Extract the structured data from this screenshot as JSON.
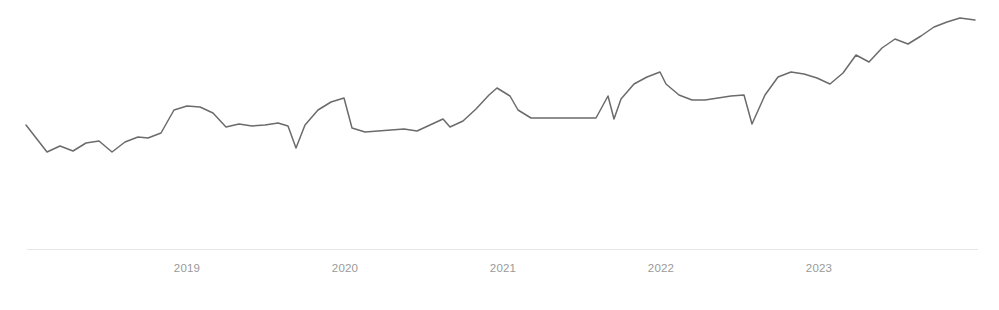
{
  "chart_data": {
    "type": "line",
    "title": "",
    "subtitle": "",
    "xlabel": "",
    "ylabel": "",
    "grid": false,
    "legend": null,
    "axis_color": "#e6e6e6",
    "series_color": "#6b6b6b",
    "tick_label_color": "#9a9a9a",
    "background": "#ffffff",
    "xlim": [
      "2018-09",
      "2024-06"
    ],
    "ylim": [
      0,
      100
    ],
    "x_tick_labels": [
      "2019",
      "2020",
      "2021",
      "2022",
      "2023"
    ],
    "x_tick_positions_px": [
      187,
      345,
      503,
      661,
      819
    ],
    "x": [
      "2018-09",
      "2018-10",
      "2018-11",
      "2018-12",
      "2019-01",
      "2019-02",
      "2019-03",
      "2019-04",
      "2019-05",
      "2019-06",
      "2019-07",
      "2019-08",
      "2019-09",
      "2019-10",
      "2019-11",
      "2019-12",
      "2020-01",
      "2020-02",
      "2020-03",
      "2020-04",
      "2020-05",
      "2020-06",
      "2020-07",
      "2020-08",
      "2020-09",
      "2020-10",
      "2020-11",
      "2020-12",
      "2021-01",
      "2021-02",
      "2021-03",
      "2021-04",
      "2021-05",
      "2021-06",
      "2021-07",
      "2021-08",
      "2021-09",
      "2021-10",
      "2021-11",
      "2021-12",
      "2022-01",
      "2022-02",
      "2022-03",
      "2022-04",
      "2022-05",
      "2022-06",
      "2022-07",
      "2022-08",
      "2022-09",
      "2022-10",
      "2022-11",
      "2022-12",
      "2023-01",
      "2023-02",
      "2023-03",
      "2023-04",
      "2023-05",
      "2023-06",
      "2023-07",
      "2023-08",
      "2023-09",
      "2023-10",
      "2023-11",
      "2023-12",
      "2024-01",
      "2024-02",
      "2024-03",
      "2024-04",
      "2024-05",
      "2024-06",
      "2024-07",
      "2024-08"
    ],
    "values": [
      55.0,
      44.5,
      47.0,
      45.0,
      48.5,
      49.5,
      44.0,
      49.0,
      51.5,
      51.0,
      52.5,
      53.0,
      53.5,
      49.5,
      51.5,
      62.0,
      65.0,
      64.5,
      62.0,
      57.5,
      58.0,
      54.0,
      45.5,
      54.5,
      57.0,
      56.5,
      56.0,
      49.0,
      54.0,
      69.0,
      67.5,
      58.5,
      56.0,
      61.0,
      59.5,
      59.0,
      57.5,
      58.0,
      59.0,
      58.0,
      57.5,
      57.5,
      65.5,
      57.0,
      72.0,
      69.5,
      74.5,
      71.0,
      66.5,
      64.5,
      65.5,
      68.0,
      67.5,
      68.0,
      58.5,
      70.0,
      74.5,
      73.0,
      73.5,
      72.0,
      70.5,
      69.5,
      71.5,
      75.5,
      79.0,
      75.0,
      72.5,
      78.5,
      83.5,
      88.0,
      90.0,
      92.0
    ],
    "points_px": [
      [
        26,
        125
      ],
      [
        47,
        152
      ],
      [
        60,
        146
      ],
      [
        73,
        151
      ],
      [
        86,
        143
      ],
      [
        99,
        141
      ],
      [
        112,
        152
      ],
      [
        125,
        142
      ],
      [
        138,
        137
      ],
      [
        148,
        138
      ],
      [
        161,
        133
      ],
      [
        174,
        110
      ],
      [
        187,
        106
      ],
      [
        200,
        107
      ],
      [
        213,
        113
      ],
      [
        226,
        127
      ],
      [
        239,
        124
      ],
      [
        252,
        126
      ],
      [
        265,
        125
      ],
      [
        278,
        123
      ],
      [
        288,
        126
      ],
      [
        296,
        148
      ],
      [
        305,
        125
      ],
      [
        318,
        110
      ],
      [
        331,
        102
      ],
      [
        344,
        98
      ],
      [
        352,
        128
      ],
      [
        365,
        132
      ],
      [
        378,
        131
      ],
      [
        391,
        130
      ],
      [
        404,
        129
      ],
      [
        417,
        131
      ],
      [
        430,
        125
      ],
      [
        443,
        119
      ],
      [
        450,
        127
      ],
      [
        463,
        121
      ],
      [
        476,
        109
      ],
      [
        489,
        95
      ],
      [
        497,
        88
      ],
      [
        510,
        96
      ],
      [
        518,
        110
      ],
      [
        531,
        118
      ],
      [
        544,
        118
      ],
      [
        557,
        118
      ],
      [
        570,
        118
      ],
      [
        583,
        118
      ],
      [
        596,
        118
      ],
      [
        608,
        96
      ],
      [
        614,
        119
      ],
      [
        621,
        99
      ],
      [
        634,
        84
      ],
      [
        647,
        77
      ],
      [
        660,
        72
      ],
      [
        666,
        84
      ],
      [
        679,
        95
      ],
      [
        692,
        100
      ],
      [
        705,
        100
      ],
      [
        718,
        98
      ],
      [
        731,
        96
      ],
      [
        744,
        95
      ],
      [
        752,
        124
      ],
      [
        765,
        95
      ],
      [
        778,
        77
      ],
      [
        791,
        72
      ],
      [
        804,
        74
      ],
      [
        817,
        78
      ],
      [
        830,
        84
      ],
      [
        843,
        73
      ],
      [
        856,
        55
      ],
      [
        869,
        62
      ],
      [
        882,
        48
      ],
      [
        895,
        39
      ],
      [
        908,
        44
      ],
      [
        921,
        36
      ],
      [
        934,
        27
      ],
      [
        947,
        22
      ],
      [
        960,
        18
      ],
      [
        975,
        20
      ]
    ]
  },
  "chart": {
    "axis": {
      "x_start_px": 27,
      "x_end_px": 978,
      "y_px": 249
    },
    "ticks": [
      {
        "label": "2019",
        "x_px": 187
      },
      {
        "label": "2020",
        "x_px": 345
      },
      {
        "label": "2021",
        "x_px": 503
      },
      {
        "label": "2022",
        "x_px": 661
      },
      {
        "label": "2023",
        "x_px": 819
      }
    ],
    "caption": " "
  }
}
